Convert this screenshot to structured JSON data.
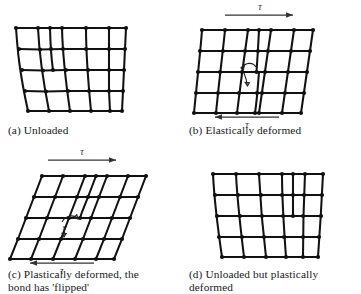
{
  "figure": {
    "kind": "crystal-lattice-dislocation-diagram",
    "panel_count": 4,
    "bond_color": "#111111",
    "arrow_color": "#333333",
    "shear_symbol": "τ"
  },
  "panels": [
    {
      "id": "a",
      "caption": "(a) Unloaded",
      "state": "unloaded",
      "lattice": {
        "cols": 5,
        "rows": 4,
        "shape": "trapezoid-bowed",
        "dislocation": true,
        "dislocation_side": "left-of-center",
        "dislocation_marker": false
      },
      "arrows": []
    },
    {
      "id": "b",
      "caption": "(b) Elastically deformed",
      "state": "elastically-deformed",
      "lattice": {
        "cols": 5,
        "rows": 4,
        "shape": "sheared-slight",
        "dislocation": true,
        "dislocation_side": "center",
        "dislocation_marker": true
      },
      "arrows": [
        {
          "position": "top",
          "direction": "right",
          "label": "τ"
        },
        {
          "position": "bottom",
          "direction": "left",
          "label": "τ"
        }
      ]
    },
    {
      "id": "c",
      "caption": "(c) Plastically deformed, the\nbond has 'flipped'",
      "state": "plastically-deformed",
      "lattice": {
        "cols": 5,
        "rows": 4,
        "shape": "parallelogram-sheared",
        "dislocation": true,
        "dislocation_side": "center-left",
        "dislocation_marker": true
      },
      "arrows": [
        {
          "position": "top",
          "direction": "right",
          "label": "τ"
        },
        {
          "position": "bottom",
          "direction": "left",
          "label": "τ"
        }
      ]
    },
    {
      "id": "d",
      "caption": "(d) Unloaded but plastically\ndeformed",
      "state": "unloaded-plastically-deformed",
      "lattice": {
        "cols": 5,
        "rows": 4,
        "shape": "trapezoid-bowed",
        "dislocation": true,
        "dislocation_side": "right-of-center",
        "dislocation_marker": false
      },
      "arrows": []
    }
  ]
}
